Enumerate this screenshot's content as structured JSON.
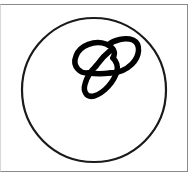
{
  "figure": {
    "frame": {
      "stroke": "#8a8a8a"
    },
    "circle": {
      "cx": 94,
      "cy": 90,
      "r": 72,
      "stroke": "#1a1a1a",
      "stroke_width": 2.2
    },
    "knot": {
      "stroke": "#000000",
      "stroke_width": 5.5
    }
  }
}
